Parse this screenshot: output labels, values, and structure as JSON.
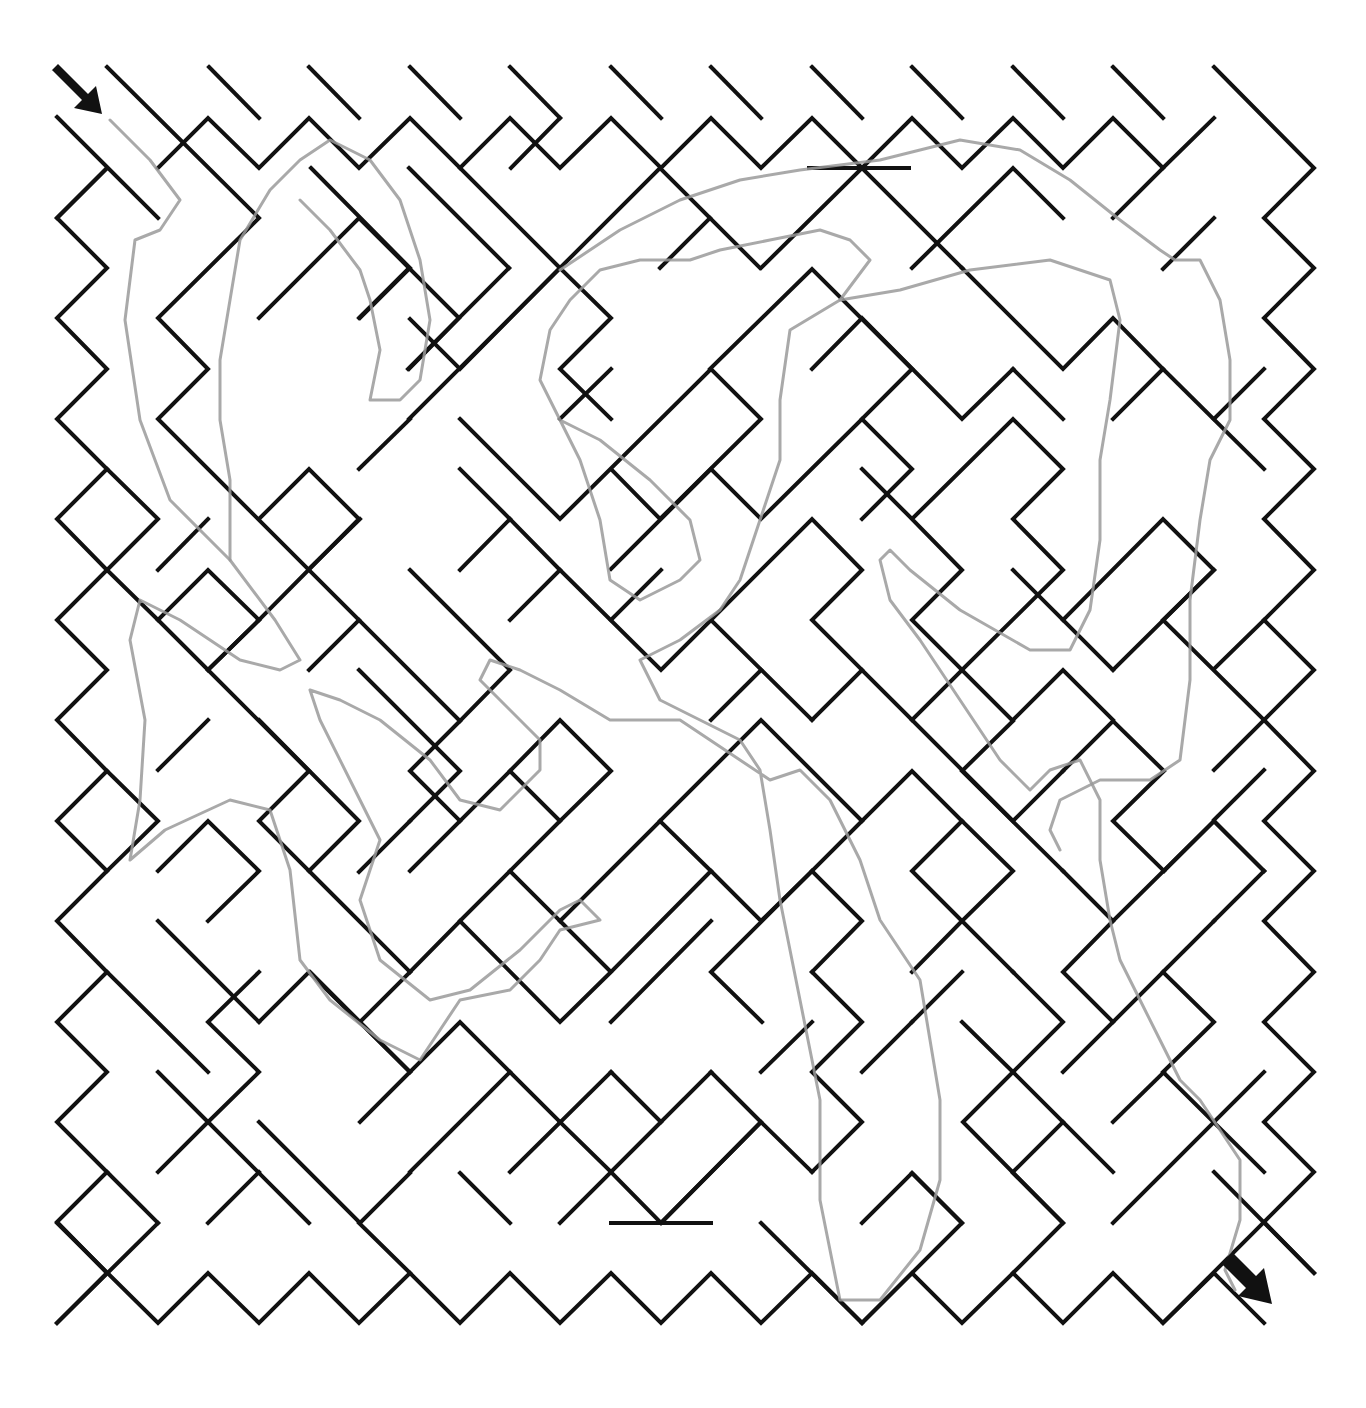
{
  "puzzle": {
    "type": "diagonal maze",
    "entrance": {
      "label": "start",
      "icon": "arrow-down-right-icon",
      "position": "top-left"
    },
    "exit": {
      "label": "finish",
      "icon": "arrow-down-right-icon",
      "position": "bottom-right"
    },
    "wall_color": "#111111",
    "solution_color": "#9a9a9a",
    "grid": {
      "origin": [
        57,
        67
      ],
      "step": 50.25,
      "cols": 25,
      "rows": 25
    }
  },
  "walls": [
    "57,117 158,218",
    "107,67 259,218 158,318 208,369 158,419 460,721 410,771 460,821",
    "158,168 208,118 259,168 309,118 359,168 410,118 460,168 510,118 560,168 611,118 661,168 711,118 761,168 812,118 862,168 912,118 962,168 1013,118 1063,168 1113,118 1163,168 1214,118",
    "209,67 259,118",
    "309,67 359,118",
    "410,67 460,118",
    "510,67 560,118",
    "611,67 661,118",
    "711,67 761,118",
    "812,67 862,118",
    "912,67 962,118",
    "1013,67 1063,118",
    "1113,67 1163,118",
    "1214,67 1314,168 1264,218 1314,268 1264,318 1314,369 1264,419 1314,469 1264,519 1314,570 1264,620 1314,670 1264,720 1314,771 1264,821 1314,871 1264,921 1314,972 1264,1022 1314,1072 1264,1122 1314,1172 1264,1222 1314,1273",
    "57,218 107,168 107,168",
    "107,168 57,218 107,268 57,318 107,369 57,419 107,469 57,519 107,570 57,620 107,670 57,720 107,771 57,821 107,871 57,921 107,972 57,1022 107,1072 57,1122 107,1172 57,1222 107,1273 57,1323",
    "57,1323 158,1223",
    "57,1223 158,1323 208,1273 259,1323 309,1273 359,1323 410,1273 460,1323 510,1273 560,1323 611,1273 661,1323 711,1273 761,1323 812,1273 862,1323 912,1273 962,1323 1013,1273 1063,1323 1113,1273 1163,1323 1214,1273 1264,1323",
    "1214,1172 1314,1273",
    "1163,1323 1263,1223",
    "409,168 509,268",
    "259,318 359,218 459,318 409,369",
    "359,318 409,268",
    "509,268 408,369",
    "311,168 410,268 360,318",
    "460,168 560,268 460,369 410,319",
    "511,168 560,118",
    "560,268 660,168 760,268",
    "660,268 710,218",
    "761,268 862,168 962,268",
    "809,168 909,168",
    "409,419 560,268 611,318 560,369 611,419",
    "460,419 560,519 711,369 761,419 660,519 611,469",
    "560,419 611,369",
    "611,569 711,469 761,519 862,419 912,469 862,519",
    "710,369 812,269 912,369 862,419",
    "912,268 1013,168 1063,218",
    "962,268 1063,369 1113,318 1163,369 1113,419",
    "1013,369 1063,419",
    "1113,218 1163,168",
    "1163,269 1214,218",
    "1163,369 1264,469",
    "1214,419 1264,369",
    "812,369 862,318 962,419 1013,369",
    "862,469 912,519 1013,419 1063,469 1013,519 1063,570 962,670 912,620 962,570 912,519",
    "1013,570 1113,670",
    "1063,620 1163,519 1214,570 1163,620 1264,720",
    "1214,669 1264,620",
    "1214,770 1264,720",
    "1113,670 1214,570",
    "259,519 309,469 359,519 259,620",
    "359,469 410,419",
    "309,569 360,519",
    "158,570 208,519",
    "107,469 158,519 107,570 158,620 208,570 259,620 208,670",
    "158,620 208,670 259,620",
    "410,570 510,670 460,721",
    "460,570 510,519 560,570 510,620",
    "510,519 460,469",
    "560,570 661,670 711,620 812,720",
    "611,620 661,570",
    "711,620 812,519 862,570 812,620 862,670",
    "761,670 711,720",
    "812,720 862,670 912,720 962,670 1013,721 962,771 1063,871",
    "912,720 1013,821 1063,771",
    "1013,720 1063,670 1113,720",
    "1063,771 1113,721 1164,771 1113,821 1164,871",
    "1214,820 1264,770",
    "1164,871 1214,821 1264,871",
    "1214,921 1264,871",
    "208,670 309,771 259,821 309,871",
    "309,670 359,620",
    "359,670 460,771 410,821",
    "259,720 359,821 309,871 410,972",
    "359,872 410,821",
    "158,770 208,720",
    "158,871 208,821 259,871 208,921",
    "107,771 158,821 107,871",
    "410,871 510,771 560,821 510,871",
    "510,771 560,720 611,771 560,821",
    "410,972 460,921 560,1022 611,972 560,921 660,821 711,871 611,972",
    "460,921 510,871 560,921",
    "660,821 761,720 862,821 812,871",
    "711,871 761,921 812,871 862,921 812,972",
    "762,1022 711,972 812,871",
    "611,1022 711,921",
    "862,821 912,771 962,821 912,871 962,921 912,972",
    "962,821 1013,871 962,921 1013,972",
    "1063,871 1113,921 1063,972 1113,1022",
    "1113,921 1214,821 1264,871",
    "1063,1072 1163,972 1214,1022 1163,1072 1264,1172",
    "1163,972 1214,921",
    "1214,1122 1264,1072",
    "1013,972 1063,1022 1013,1072 1113,1172",
    "962,1022 1013,1072 963,1122 1063,1223",
    "912,1022 962,972",
    "862,1072 912,1022",
    "812,972 862,1022 812,1072 862,1122 812,1172",
    "761,1072 812,1022",
    "711,1072 761,1122 661,1223",
    "661,1122 711,1072",
    "611,1072 661,1122 611,1172 560,1122",
    "510,1172 611,1072",
    "560,1223 611,1172 661,1223 761,1122 812,1172",
    "761,1223 862,1323",
    "611,1223 711,1223",
    "410,1172 510,1072 560,1122",
    "410,1072 460,1022 510,1072",
    "360,1022 410,972",
    "310,972 410,1072 360,1122",
    "259,1022 309,972 410,1072",
    "259,1122 360,1223 410,1173",
    "309,1223 208,1122 259,1072 208,1022 259,972",
    "158,921 259,1022",
    "107,972 208,1072",
    "158,1072 208,1122 158,1172",
    "107,1172 158,1223",
    "208,1223 259,1172",
    "359,1223 410,1273",
    "460,1173 510,1223",
    "912,1173 962,1223",
    "862,1223 912,1173 962,1223 862,1323",
    "1013,1172 1063,1122",
    "1113,1122 1164,1072",
    "1113,1223 1214,1122",
    "1013,1273 1063,1223 1013,1173"
  ],
  "solution_path": "110,120 150,160 180,200 160,230 135,240 125,320 140,420 170,500 230,560 275,620 300,660 280,670 240,660 180,620 140,600 130,640 145,720 140,800 130,860 165,830 230,800 270,810 290,870 300,960 330,1000 380,1040 420,1060 440,1030 460,1000 510,990 540,960 560,930 600,920 580,900 560,910 520,950 470,990 430,1000 380,960 360,900 380,840 350,780 320,720 310,690 340,700 380,720 430,760 460,800 500,810 540,770 540,740 500,700 480,680 490,660 520,670 560,690 610,720 680,720 740,760 770,780 800,770 830,800 860,860 880,920 920,980 930,1040 940,1100 940,1180 920,1250 880,1300 840,1300 820,1200 820,1100 800,1000 780,900 770,830 760,770 740,740 700,720 660,700 640,660 680,640 720,610 740,580 760,520 780,460 780,400 790,330 840,300 900,290 970,270 1050,260 1110,280 1120,320 1110,400 1100,460 1100,540 1090,610 1070,650 1030,650 960,610 910,570 890,550 880,560 890,600 920,640 960,700 1000,760 1030,790 1050,770 1080,760 1100,800 1100,860 1110,920 1120,960 1140,1000 1160,1040 1180,1080 1200,1100 1220,1130 1240,1160 1240,1220 1225,1270 1235,1290",
  "solution_path_upper": "840,300 870,260 850,240 820,230 770,240 720,250 690,260 640,260 600,270 570,300 550,330 540,380 560,420 580,460 600,520 610,580 640,600 680,580 700,560 690,520 650,480 600,440 560,420",
  "solution_path_mid": "230,560 230,480 220,420 220,360 230,300 240,240 270,190 300,160 330,140 370,160 400,200 420,260 430,320 420,380 400,400 370,400 380,350 370,300 360,270 330,230 300,200",
  "solution_path_top": "560,270 620,230 680,200 740,180 800,170 880,160 920,150 960,140 1020,150 1070,180 1120,220 1160,250 1175,260 1200,260 1220,300 1230,360 1230,420 1210,460 1200,520 1190,600 1190,680 1180,760 1150,780 1100,780 1060,800 1050,830 1060,850"
}
